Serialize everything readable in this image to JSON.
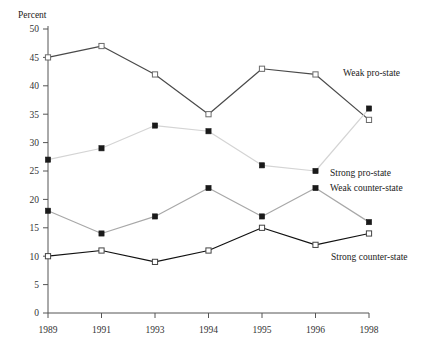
{
  "chart_data": {
    "type": "line",
    "title": "",
    "xlabel": "",
    "ylabel": "Percent",
    "categories": [
      "1989",
      "1991",
      "1993",
      "1994",
      "1995",
      "1996",
      "1998"
    ],
    "ylim": [
      0,
      50
    ],
    "yticks": [
      0,
      5,
      10,
      15,
      20,
      25,
      30,
      35,
      40,
      45,
      50
    ],
    "grid": false,
    "legend_position": "inline-right",
    "series": [
      {
        "name": "Weak pro-state",
        "values": [
          45,
          47,
          42,
          35,
          43,
          42,
          34
        ],
        "line_color": "#4a4a4a",
        "marker": "open-square",
        "marker_fill": "#ffffff",
        "marker_stroke": "#6b6b6b"
      },
      {
        "name": "Strong pro-state",
        "values": [
          27,
          29,
          33,
          32,
          26,
          25,
          36
        ],
        "line_color": "#d4d4d4",
        "marker": "filled-square",
        "marker_fill": "#1a1a1a",
        "marker_stroke": "#1a1a1a"
      },
      {
        "name": "Weak counter-state",
        "values": [
          18,
          14,
          17,
          22,
          17,
          22,
          16
        ],
        "line_color": "#a8a8a8",
        "marker": "filled-square",
        "marker_fill": "#1a1a1a",
        "marker_stroke": "#1a1a1a"
      },
      {
        "name": "Strong counter-state",
        "values": [
          10,
          11,
          9,
          11,
          15,
          12,
          14
        ],
        "line_color": "#111111",
        "marker": "open-square",
        "marker_fill": "#ffffff",
        "marker_stroke": "#444444"
      }
    ],
    "series_label_positions": [
      {
        "name": "Weak pro-state",
        "x": 343,
        "y": 76
      },
      {
        "name": "Strong pro-state",
        "x": 330,
        "y": 176
      },
      {
        "name": "Weak counter-state",
        "x": 330,
        "y": 191
      },
      {
        "name": "Strong counter-state",
        "x": 331,
        "y": 260
      }
    ]
  },
  "axis": {
    "y_title": "Percent",
    "y_title_x": 18,
    "y_title_y": 18
  }
}
